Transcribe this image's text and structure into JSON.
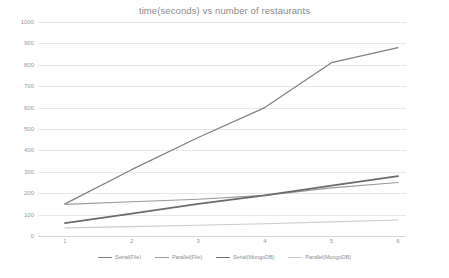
{
  "chart_data": {
    "type": "line",
    "title": "time(seconds) vs number of restaurants",
    "xlabel": "",
    "ylabel": "",
    "categories": [
      "1",
      "2",
      "3",
      "4",
      "5",
      "6"
    ],
    "ylim": [
      0,
      1000
    ],
    "yticks": [
      0,
      100,
      200,
      300,
      400,
      500,
      600,
      700,
      800,
      900,
      1000
    ],
    "grid": true,
    "legend_position": "bottom",
    "series": [
      {
        "name": "Serial(File)",
        "color": "#808080",
        "width": 1.2,
        "values": [
          150,
          310,
          460,
          600,
          810,
          880
        ]
      },
      {
        "name": "Parallel(File)",
        "color": "#9a9a9a",
        "width": 1.1,
        "values": [
          148,
          160,
          172,
          190,
          225,
          250
        ]
      },
      {
        "name": "Serial(MongoDB)",
        "color": "#6b6b6b",
        "width": 1.8,
        "values": [
          60,
          105,
          150,
          190,
          235,
          280
        ]
      },
      {
        "name": "Parallel(MongoDB)",
        "color": "#cccccc",
        "width": 1.1,
        "values": [
          38,
          44,
          50,
          57,
          66,
          75
        ]
      }
    ]
  },
  "legend": {
    "items": [
      {
        "label": "Serial(File)"
      },
      {
        "label": "Parallel(File)"
      },
      {
        "label": "Serial(MongoDB)"
      },
      {
        "label": "Parallel(MongoDB)"
      }
    ]
  }
}
